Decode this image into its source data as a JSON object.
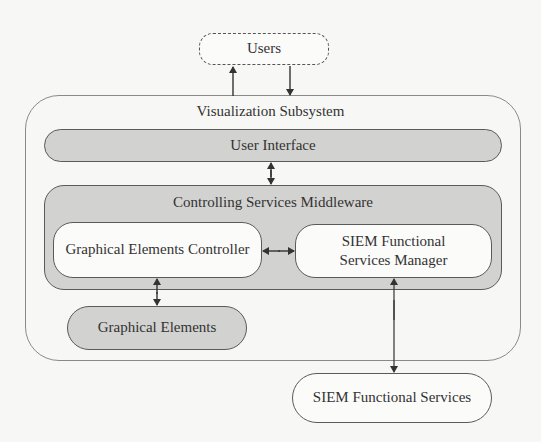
{
  "diagram": {
    "nodes": {
      "users": {
        "label": "Users",
        "style": "dashed-pill"
      },
      "visualization_subsystem": {
        "label": "Visualization Subsystem",
        "style": "container"
      },
      "user_interface": {
        "label": "User Interface",
        "style": "grey-pill"
      },
      "middleware": {
        "label": "Controlling Services Middleware",
        "style": "grey-container"
      },
      "graphical_elements_controller": {
        "label": "Graphical Elements Controller",
        "style": "white-rounded"
      },
      "siem_functional_services_manager": {
        "label_line1": "SIEM Functional",
        "label_line2": "Services Manager",
        "style": "white-rounded"
      },
      "graphical_elements": {
        "label": "Graphical Elements",
        "style": "grey-pill"
      },
      "siem_functional_services": {
        "label": "SIEM Functional Services",
        "style": "white-pill"
      }
    },
    "edges": [
      {
        "from": "visualization_subsystem",
        "to": "users",
        "direction": "up"
      },
      {
        "from": "users",
        "to": "visualization_subsystem",
        "direction": "down"
      },
      {
        "from": "user_interface",
        "to": "middleware",
        "direction": "bidirectional"
      },
      {
        "from": "graphical_elements_controller",
        "to": "siem_functional_services_manager",
        "direction": "bidirectional"
      },
      {
        "from": "graphical_elements_controller",
        "to": "graphical_elements",
        "direction": "bidirectional"
      },
      {
        "from": "siem_functional_services_manager",
        "to": "siem_functional_services",
        "direction": "bidirectional"
      }
    ],
    "colors": {
      "background": "#f7f7f5",
      "grey_fill": "#d2d2d0",
      "white_fill": "#fbfbfa",
      "stroke": "#5a5a5a"
    }
  }
}
